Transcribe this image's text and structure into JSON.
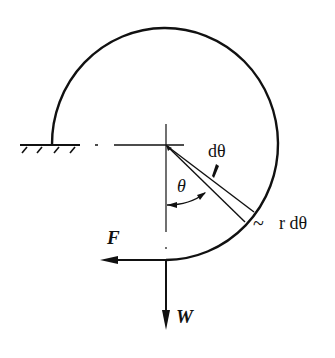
{
  "figure": {
    "labels": {
      "d_theta": "dθ",
      "theta": "θ",
      "r_d_theta": "r dθ",
      "tilde": "~",
      "force_F": "F",
      "weight_W": "W"
    },
    "colors": {
      "line": "#111111",
      "background": "#ffffff"
    }
  }
}
